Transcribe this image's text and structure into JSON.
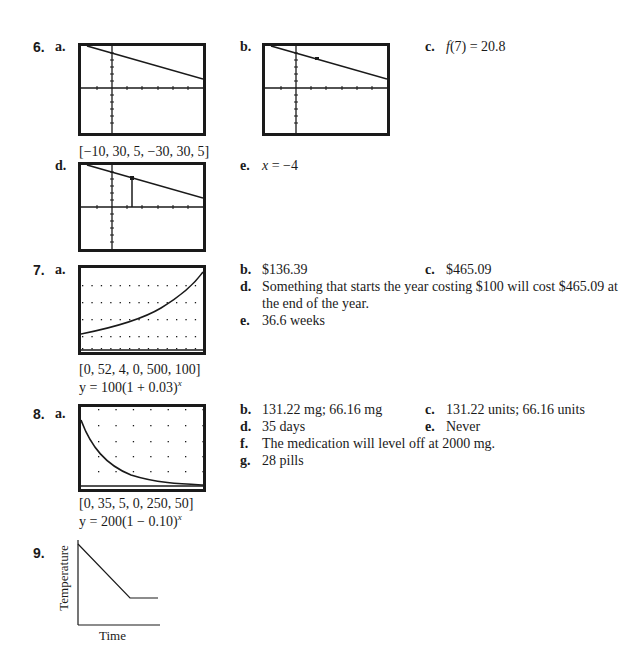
{
  "problems": [
    {
      "number": "6.",
      "parts": {
        "a": {
          "label": "a.",
          "window": "[−10, 30, 5, −30, 30, 5]"
        },
        "b": {
          "label": "b."
        },
        "c": {
          "label": "c.",
          "fn": "f",
          "text": "(7) = 20.8"
        },
        "d": {
          "label": "d."
        },
        "e": {
          "label": "e.",
          "var": "x",
          "text": " = −4"
        }
      }
    },
    {
      "number": "7.",
      "parts": {
        "a": {
          "label": "a.",
          "window": "[0, 52, 4, 0, 500, 100]",
          "eq_prefix": "y = 100(1 + 0.03)",
          "eq_exp": "x"
        },
        "b": {
          "label": "b.",
          "text": "$136.39"
        },
        "c": {
          "label": "c.",
          "text": "$465.09"
        },
        "d": {
          "label": "d.",
          "line1": "Something that starts the year costing $100 will cost $465.09 at",
          "line2": "the end of the year."
        },
        "e": {
          "label": "e.",
          "text": "36.6 weeks"
        }
      }
    },
    {
      "number": "8.",
      "parts": {
        "a": {
          "label": "a.",
          "window": "[0, 35, 5, 0, 250, 50]",
          "eq_prefix": "y = 200(1 − 0.10)",
          "eq_exp": "x"
        },
        "b": {
          "label": "b.",
          "text": "131.22 mg; 66.16 mg"
        },
        "c": {
          "label": "c.",
          "text": "131.22 units; 66.16 units"
        },
        "d": {
          "label": "d.",
          "text": "35 days"
        },
        "e": {
          "label": "e.",
          "text": "Never"
        },
        "f": {
          "label": "f.",
          "text": "The medication will level off at 2000 mg."
        },
        "g": {
          "label": "g.",
          "text": "28 pills"
        }
      }
    },
    {
      "number": "9.",
      "sketch": {
        "ylabel": "Temperature",
        "xlabel": "Time"
      }
    }
  ],
  "chart_data": [
    {
      "id": "6a",
      "type": "line",
      "title": "",
      "window": {
        "xmin": -10,
        "xmax": 30,
        "xscl": 5,
        "ymin": -30,
        "ymax": 30,
        "yscl": 5
      },
      "description": "decreasing linear function",
      "grid": false
    },
    {
      "id": "6b",
      "type": "line",
      "title": "",
      "window": {
        "xmin": -10,
        "xmax": 30,
        "xscl": 5,
        "ymin": -30,
        "ymax": 30,
        "yscl": 5
      },
      "description": "decreasing line with traced point",
      "grid": false
    },
    {
      "id": "6d",
      "type": "line",
      "title": "",
      "window": {
        "xmin": -10,
        "xmax": 30,
        "xscl": 5,
        "ymin": -30,
        "ymax": 30,
        "yscl": 5
      },
      "description": "decreasing line with vertical segment from x-axis to point",
      "grid": false
    },
    {
      "id": "7a",
      "type": "line",
      "title": "y = 100(1 + 0.03)^x",
      "window": {
        "xmin": 0,
        "xmax": 52,
        "xscl": 4,
        "ymin": 0,
        "ymax": 500,
        "yscl": 100
      },
      "x": [
        0,
        13,
        26,
        39,
        52
      ],
      "y": [
        100,
        146.9,
        215.7,
        316.7,
        465.1
      ],
      "grid": true
    },
    {
      "id": "8a",
      "type": "line",
      "title": "y = 200(1 − 0.10)^x",
      "window": {
        "xmin": 0,
        "xmax": 35,
        "xscl": 5,
        "ymin": 0,
        "ymax": 250,
        "yscl": 50
      },
      "x": [
        0,
        5,
        10,
        15,
        20,
        25,
        30,
        35
      ],
      "y": [
        200,
        118.1,
        69.7,
        41.2,
        24.3,
        14.4,
        8.5,
        5.0
      ],
      "grid": true
    },
    {
      "id": "9",
      "type": "line",
      "title": "",
      "xlabel": "Time",
      "ylabel": "Temperature",
      "description": "linear decrease then constant",
      "grid": false
    }
  ]
}
